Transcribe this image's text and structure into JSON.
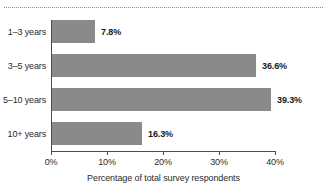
{
  "chart_data": {
    "type": "bar",
    "orientation": "horizontal",
    "title": "",
    "xlabel": "Percentage of total survey respondents",
    "ylabel": "",
    "categories": [
      "1–3 years",
      "3–5 years",
      "5–10 years",
      "10+ years"
    ],
    "values": [
      7.8,
      36.6,
      39.3,
      16.3
    ],
    "data_labels": [
      "7.8%",
      "36.6%",
      "39.3%",
      "16.3%"
    ],
    "xlim": [
      0,
      40
    ],
    "xticks": [
      0,
      10,
      20,
      30,
      40
    ],
    "xtick_labels": [
      "0%",
      "10%",
      "20%",
      "30%",
      "40%"
    ],
    "grid": false,
    "legend": null,
    "bar_color": "#8a8a8a",
    "axis_color": "#4d4d4d",
    "text_color": "#2b2b2b",
    "background": "#ffffff"
  },
  "decorations": {
    "top_rule_style": "dotted",
    "top_rule_color": "#8d8d8d"
  }
}
